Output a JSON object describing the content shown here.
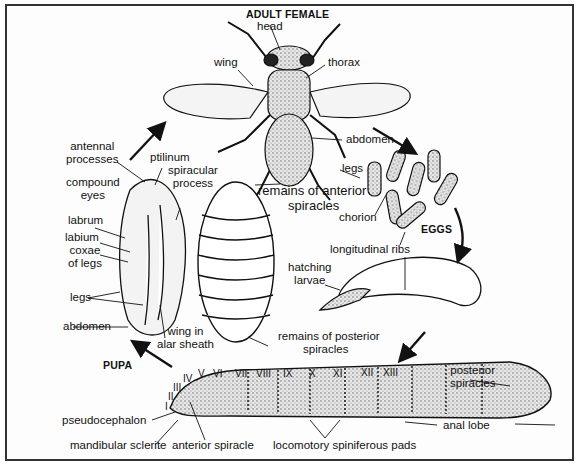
{
  "diagram": {
    "stages": {
      "adult": "ADULT FEMALE",
      "eggs": "EGGS",
      "pupa": "PUPA"
    },
    "adult_labels": {
      "head": "head",
      "wing": "wing",
      "thorax": "thorax",
      "abdomen": "abdomen",
      "legs": "legs"
    },
    "egg_labels": {
      "chorion": "chorion",
      "longitudinal_ribs": "longitudinal ribs",
      "hatching_larvae_1": "hatching",
      "hatching_larvae_2": "larvae"
    },
    "puparium_labels": {
      "anterior_remains_1": "remains of anterior",
      "anterior_remains_2": "spiracles",
      "posterior_remains_1": "remains of posterior",
      "posterior_remains_2": "spiracles"
    },
    "pupa_labels": {
      "antennal_processes_1": "antennal",
      "antennal_processes_2": "processes",
      "ptilinum": "ptilinum",
      "spiracular_process_1": "spiracular",
      "spiracular_process_2": "process",
      "compound_eyes_1": "compound",
      "compound_eyes_2": "eyes",
      "labrum": "labrum",
      "labium": "labium",
      "coxae_1": "coxae",
      "coxae_2": "of legs",
      "legs": "legs",
      "abdomen": "abdomen",
      "wing_sheath_1": "wing in",
      "wing_sheath_2": "alar sheath"
    },
    "larva_labels": {
      "segments": [
        "I",
        "II",
        "III",
        "IV",
        "V",
        "VI",
        "VII",
        "VIII",
        "IX",
        "X",
        "XI",
        "XII",
        "XIII"
      ],
      "pseudocephalon": "pseudocephalon",
      "mandibular_sclerite": "mandibular sclerite",
      "anterior_spiracle": "anterior spiracle",
      "locomotory_pads": "locomotory spiniferous pads",
      "posterior_spiracles_1": "posterior",
      "posterior_spiracles_2": "spiracles",
      "anal_lobe": "anal lobe"
    }
  }
}
